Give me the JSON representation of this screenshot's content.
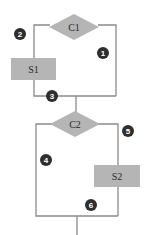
{
  "diagram": {
    "type": "flowchart",
    "colors": {
      "line": "#8a8a8a",
      "shape_fill": "#b5b5b5",
      "badge_fill": "#2e2e2e",
      "badge_text": "#ffffff",
      "label_text": "#2b2b2b"
    },
    "decisions": [
      {
        "id": "C1",
        "label": "C1"
      },
      {
        "id": "C2",
        "label": "C2"
      }
    ],
    "statements": [
      {
        "id": "S1",
        "label": "S1"
      },
      {
        "id": "S2",
        "label": "S2"
      }
    ],
    "path_markers": [
      {
        "label": "1"
      },
      {
        "label": "2"
      },
      {
        "label": "3"
      },
      {
        "label": "4"
      },
      {
        "label": "5"
      },
      {
        "label": "6"
      }
    ]
  }
}
